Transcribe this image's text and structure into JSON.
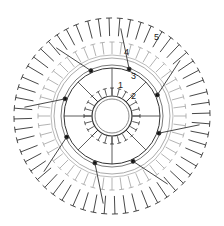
{
  "diagram": {
    "type": "crochet-chart",
    "center": [
      112,
      116
    ],
    "rounds": [
      {
        "label": "1",
        "x": 118,
        "y": 88
      },
      {
        "label": "2",
        "x": 131,
        "y": 99
      },
      {
        "label": "3",
        "x": 131,
        "y": 79
      },
      {
        "label": "4",
        "x": 124,
        "y": 55
      },
      {
        "label": "5",
        "x": 154,
        "y": 40
      }
    ],
    "petals": 8,
    "colors": {
      "dark": "#222222",
      "light": "#aaaaaa",
      "ring": "#999999"
    }
  }
}
